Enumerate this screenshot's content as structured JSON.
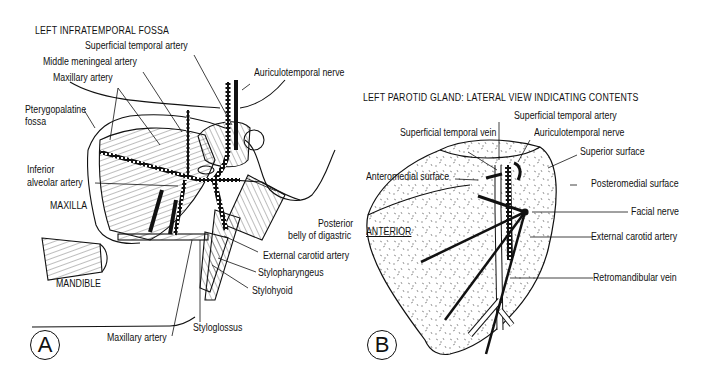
{
  "panel_a": {
    "title": "LEFT INFRATEMPORAL FOSSA",
    "badge": "A",
    "labels": {
      "superficial_temporal_artery": "Superficial temporal artery",
      "middle_meningeal_artery": "Middle meningeal artery",
      "maxillary_artery_top": "Maxillary artery",
      "auriculotemporal_nerve": "Auriculotemporal nerve",
      "pterygopalatine_fossa_1": "Pterygopalatine",
      "pterygopalatine_fossa_2": "fossa",
      "inferior_alveolar_1": "Inferior",
      "inferior_alveolar_2": "alveolar artery",
      "maxilla": "MAXILLA",
      "posterior_belly_1": "Posterior",
      "posterior_belly_2": "belly of digastric",
      "external_carotid_artery": "External carotid artery",
      "stylopharyngeus": "Stylopharyngeus",
      "stylohyoid": "Stylohyoid",
      "mandible": "MANDIBLE",
      "styloglossus": "Styloglossus",
      "maxillary_artery_bottom": "Maxillary artery"
    }
  },
  "panel_b": {
    "title": "LEFT PAROTID GLAND: LATERAL VIEW INDICATING CONTENTS",
    "badge": "B",
    "labels": {
      "superficial_temporal_artery": "Superficial temporal artery",
      "superficial_temporal_vein": "Superficial temporal vein",
      "auriculotemporal_nerve": "Auriculotemporal nerve",
      "superior_surface": "Superior surface",
      "anteromedial_surface": "Anteromedial surface",
      "posteromedial_surface": "Posteromedial surface",
      "anterior": "ANTERIOR",
      "facial_nerve": "Facial nerve",
      "external_carotid_artery": "External carotid artery",
      "retromandibular_vein": "Retromandibular vein"
    }
  }
}
